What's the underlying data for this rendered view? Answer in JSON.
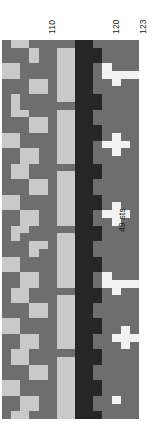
{
  "figure": {
    "caption": "49 sts",
    "orientation": "rotated-90-ccw"
  },
  "axis": {
    "ticks": [
      {
        "label": "110",
        "pos": 4
      },
      {
        "label": "120",
        "pos": 11
      },
      {
        "label": "123",
        "pos": 14
      }
    ]
  },
  "palette": {
    "dark": "#262626",
    "mid": "#6e6e6e",
    "light": "#c9c9c9",
    "white": "#f2f2f2",
    "grid": "#3b3b3b",
    "background": "#ffffff",
    "text": "#1b1b1b"
  },
  "chart_data": {
    "type": "heatmap",
    "title": "",
    "xlabel": "",
    "ylabel": "49 sts",
    "legend": [],
    "grid": true,
    "rows": 49,
    "cols": 15,
    "row_label": "49 sts",
    "col_tick_labels": [
      "110",
      "120",
      "123"
    ],
    "col_tick_positions": [
      4,
      11,
      14
    ],
    "value_levels": {
      "0": "mid",
      "1": "light",
      "2": "dark",
      "3": "white"
    },
    "values": [
      [
        0,
        1,
        1,
        0,
        0,
        0,
        0,
        0,
        2,
        2,
        0,
        0,
        0,
        0,
        0
      ],
      [
        0,
        0,
        0,
        1,
        0,
        0,
        1,
        1,
        2,
        2,
        2,
        0,
        0,
        0,
        0
      ],
      [
        0,
        0,
        0,
        1,
        0,
        0,
        1,
        1,
        2,
        2,
        2,
        0,
        0,
        0,
        0
      ],
      [
        1,
        1,
        0,
        0,
        0,
        0,
        1,
        1,
        2,
        2,
        0,
        3,
        0,
        0,
        0
      ],
      [
        1,
        1,
        0,
        0,
        0,
        0,
        1,
        1,
        2,
        2,
        0,
        3,
        3,
        3,
        3
      ],
      [
        0,
        0,
        0,
        1,
        1,
        0,
        1,
        1,
        2,
        2,
        0,
        0,
        3,
        0,
        0
      ],
      [
        0,
        0,
        0,
        1,
        1,
        0,
        1,
        1,
        2,
        2,
        0,
        0,
        0,
        0,
        0
      ],
      [
        0,
        1,
        0,
        0,
        0,
        0,
        1,
        1,
        2,
        2,
        2,
        0,
        0,
        0,
        0
      ],
      [
        0,
        1,
        0,
        0,
        0,
        0,
        0,
        0,
        2,
        2,
        2,
        0,
        0,
        0,
        0
      ],
      [
        0,
        1,
        1,
        0,
        0,
        0,
        1,
        1,
        2,
        2,
        0,
        0,
        0,
        0,
        0
      ],
      [
        0,
        0,
        0,
        1,
        1,
        0,
        1,
        1,
        2,
        2,
        0,
        0,
        0,
        0,
        0
      ],
      [
        0,
        0,
        0,
        1,
        1,
        0,
        1,
        1,
        2,
        2,
        2,
        0,
        0,
        0,
        0
      ],
      [
        1,
        1,
        0,
        0,
        0,
        0,
        1,
        1,
        2,
        2,
        2,
        0,
        3,
        0,
        0
      ],
      [
        1,
        1,
        0,
        0,
        0,
        0,
        1,
        1,
        2,
        2,
        0,
        3,
        3,
        3,
        0
      ],
      [
        0,
        0,
        1,
        1,
        0,
        0,
        1,
        1,
        2,
        2,
        0,
        0,
        3,
        0,
        0
      ],
      [
        0,
        0,
        1,
        1,
        0,
        0,
        1,
        1,
        2,
        2,
        0,
        0,
        0,
        0,
        0
      ],
      [
        0,
        1,
        1,
        0,
        0,
        0,
        0,
        0,
        2,
        2,
        2,
        0,
        0,
        0,
        0
      ],
      [
        0,
        1,
        1,
        0,
        0,
        0,
        1,
        1,
        2,
        2,
        2,
        0,
        0,
        0,
        0
      ],
      [
        0,
        0,
        0,
        1,
        1,
        0,
        1,
        1,
        2,
        2,
        0,
        0,
        0,
        0,
        0
      ],
      [
        0,
        0,
        0,
        1,
        1,
        0,
        1,
        1,
        2,
        2,
        0,
        0,
        0,
        0,
        0
      ],
      [
        1,
        1,
        0,
        0,
        0,
        0,
        1,
        1,
        2,
        2,
        2,
        0,
        0,
        0,
        0
      ],
      [
        1,
        1,
        0,
        0,
        0,
        0,
        1,
        1,
        2,
        2,
        2,
        0,
        3,
        0,
        0
      ],
      [
        0,
        0,
        1,
        1,
        0,
        0,
        1,
        1,
        2,
        2,
        0,
        3,
        3,
        3,
        0
      ],
      [
        0,
        0,
        1,
        1,
        0,
        0,
        1,
        1,
        2,
        2,
        0,
        0,
        3,
        0,
        0
      ],
      [
        0,
        1,
        1,
        0,
        0,
        0,
        0,
        0,
        2,
        2,
        2,
        0,
        0,
        0,
        0
      ],
      [
        0,
        1,
        0,
        0,
        0,
        0,
        1,
        1,
        2,
        2,
        2,
        0,
        0,
        0,
        0
      ],
      [
        0,
        0,
        0,
        1,
        1,
        0,
        1,
        1,
        2,
        2,
        0,
        0,
        0,
        0,
        0
      ],
      [
        0,
        0,
        0,
        1,
        0,
        0,
        1,
        1,
        2,
        2,
        0,
        0,
        0,
        0,
        0
      ],
      [
        1,
        1,
        0,
        0,
        0,
        0,
        1,
        1,
        2,
        2,
        2,
        0,
        0,
        0,
        0
      ],
      [
        1,
        1,
        0,
        0,
        0,
        0,
        1,
        1,
        2,
        2,
        2,
        0,
        0,
        0,
        0
      ],
      [
        0,
        0,
        1,
        1,
        0,
        0,
        1,
        1,
        2,
        2,
        0,
        3,
        0,
        0,
        0
      ],
      [
        0,
        0,
        1,
        1,
        0,
        0,
        1,
        1,
        2,
        2,
        0,
        3,
        3,
        3,
        3
      ],
      [
        0,
        1,
        1,
        0,
        0,
        0,
        0,
        0,
        2,
        2,
        2,
        0,
        3,
        0,
        0
      ],
      [
        0,
        1,
        1,
        0,
        0,
        0,
        1,
        1,
        2,
        2,
        2,
        0,
        0,
        0,
        0
      ],
      [
        0,
        0,
        0,
        1,
        1,
        0,
        1,
        1,
        2,
        2,
        0,
        0,
        0,
        0,
        0
      ],
      [
        0,
        0,
        0,
        1,
        1,
        0,
        1,
        1,
        2,
        2,
        0,
        0,
        0,
        0,
        0
      ],
      [
        1,
        1,
        0,
        0,
        0,
        0,
        1,
        1,
        2,
        2,
        2,
        0,
        0,
        0,
        0
      ],
      [
        1,
        1,
        0,
        0,
        0,
        0,
        1,
        1,
        2,
        2,
        2,
        0,
        0,
        3,
        0
      ],
      [
        0,
        0,
        1,
        1,
        0,
        0,
        1,
        1,
        2,
        2,
        0,
        0,
        3,
        3,
        3
      ],
      [
        0,
        0,
        1,
        1,
        0,
        0,
        1,
        1,
        2,
        2,
        0,
        0,
        0,
        3,
        0
      ],
      [
        0,
        1,
        1,
        0,
        0,
        0,
        0,
        0,
        2,
        2,
        2,
        0,
        0,
        0,
        0
      ],
      [
        0,
        1,
        1,
        0,
        0,
        0,
        1,
        1,
        2,
        2,
        2,
        0,
        0,
        0,
        0
      ],
      [
        0,
        0,
        0,
        1,
        1,
        0,
        1,
        1,
        2,
        2,
        0,
        0,
        0,
        0,
        0
      ],
      [
        0,
        0,
        0,
        1,
        1,
        0,
        1,
        1,
        2,
        2,
        0,
        0,
        0,
        0,
        0
      ],
      [
        1,
        1,
        0,
        0,
        0,
        0,
        1,
        1,
        2,
        2,
        2,
        0,
        0,
        0,
        0
      ],
      [
        1,
        1,
        0,
        0,
        0,
        0,
        1,
        1,
        2,
        2,
        2,
        0,
        0,
        0,
        0
      ],
      [
        0,
        0,
        1,
        1,
        0,
        0,
        1,
        1,
        2,
        2,
        0,
        0,
        3,
        0,
        0
      ],
      [
        0,
        0,
        1,
        1,
        0,
        0,
        1,
        1,
        2,
        2,
        0,
        0,
        0,
        0,
        0
      ],
      [
        0,
        1,
        1,
        0,
        0,
        0,
        1,
        1,
        2,
        2,
        2,
        0,
        0,
        0,
        0
      ]
    ]
  },
  "layout": {
    "matrix_left": 2,
    "matrix_top": 40,
    "matrix_width": 137,
    "matrix_height": 379,
    "caption_left": 118,
    "caption_bottom": 232
  }
}
